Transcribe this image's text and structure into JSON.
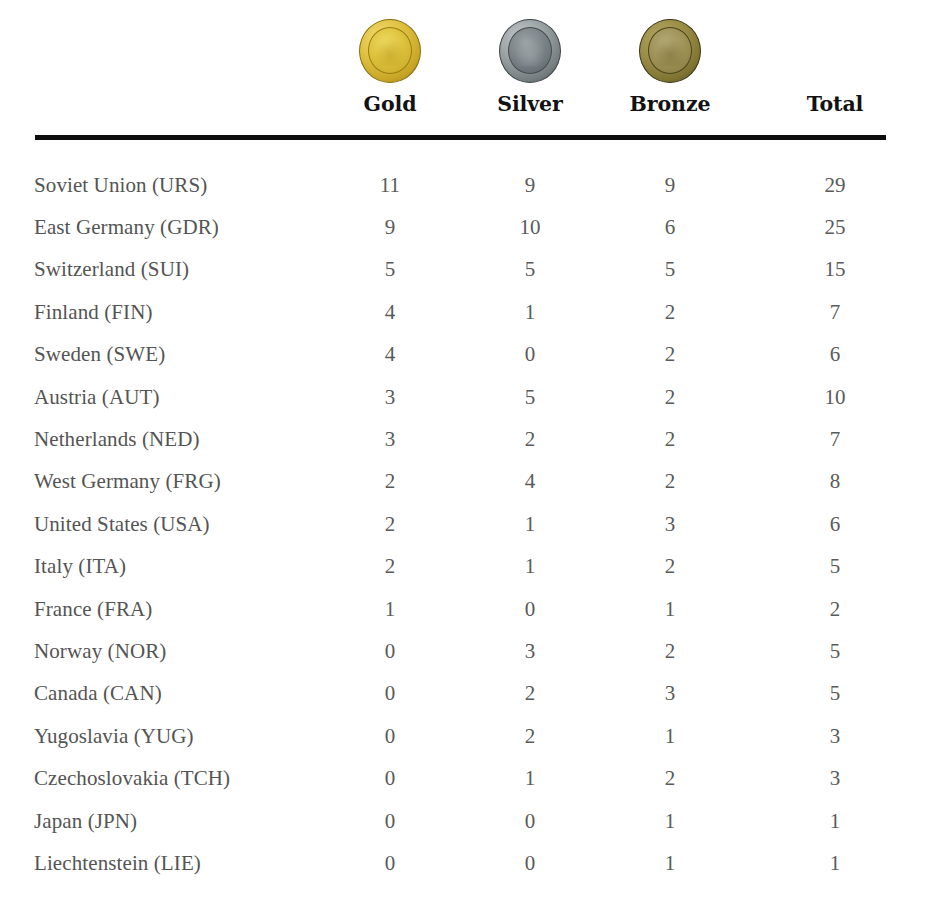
{
  "table": {
    "columns": [
      {
        "key": "nation",
        "label": "",
        "icon": null,
        "align": "left"
      },
      {
        "key": "gold",
        "label": "Gold",
        "icon": "gold-medal-icon",
        "align": "center"
      },
      {
        "key": "silver",
        "label": "Silver",
        "icon": "silver-medal-icon",
        "align": "center"
      },
      {
        "key": "bronze",
        "label": "Bronze",
        "icon": "bronze-medal-icon",
        "align": "center"
      },
      {
        "key": "total",
        "label": "Total",
        "icon": null,
        "align": "center"
      }
    ],
    "rows": [
      {
        "nation": "Soviet Union (URS)",
        "gold": "11",
        "silver": "9",
        "bronze": "9",
        "total": "29"
      },
      {
        "nation": "East Germany (GDR)",
        "gold": "9",
        "silver": "10",
        "bronze": "6",
        "total": "25"
      },
      {
        "nation": "Switzerland (SUI)",
        "gold": "5",
        "silver": "5",
        "bronze": "5",
        "total": "15"
      },
      {
        "nation": "Finland (FIN)",
        "gold": "4",
        "silver": "1",
        "bronze": "2",
        "total": "7"
      },
      {
        "nation": "Sweden (SWE)",
        "gold": "4",
        "silver": "0",
        "bronze": "2",
        "total": "6"
      },
      {
        "nation": "Austria (AUT)",
        "gold": "3",
        "silver": "5",
        "bronze": "2",
        "total": "10"
      },
      {
        "nation": "Netherlands (NED)",
        "gold": "3",
        "silver": "2",
        "bronze": "2",
        "total": "7"
      },
      {
        "nation": "West Germany (FRG)",
        "gold": "2",
        "silver": "4",
        "bronze": "2",
        "total": "8"
      },
      {
        "nation": "United States (USA)",
        "gold": "2",
        "silver": "1",
        "bronze": "3",
        "total": "6"
      },
      {
        "nation": "Italy (ITA)",
        "gold": "2",
        "silver": "1",
        "bronze": "2",
        "total": "5"
      },
      {
        "nation": "France (FRA)",
        "gold": "1",
        "silver": "0",
        "bronze": "1",
        "total": "2"
      },
      {
        "nation": "Norway (NOR)",
        "gold": "0",
        "silver": "3",
        "bronze": "2",
        "total": "5"
      },
      {
        "nation": "Canada (CAN)",
        "gold": "0",
        "silver": "2",
        "bronze": "3",
        "total": "5"
      },
      {
        "nation": "Yugoslavia (YUG)",
        "gold": "0",
        "silver": "2",
        "bronze": "1",
        "total": "3"
      },
      {
        "nation": "Czechoslovakia (TCH)",
        "gold": "0",
        "silver": "1",
        "bronze": "2",
        "total": "3"
      },
      {
        "nation": "Japan (JPN)",
        "gold": "0",
        "silver": "0",
        "bronze": "1",
        "total": "1"
      },
      {
        "nation": "Liechtenstein (LIE)",
        "gold": "0",
        "silver": "0",
        "bronze": "1",
        "total": "1"
      }
    ]
  },
  "colors": {
    "background": "#ffffff",
    "rule": "#0d0d0d",
    "header_text": "#121212",
    "body_text": "#545454",
    "gold": "#d9be3e",
    "silver": "#7b8488",
    "bronze": "#9b8e48"
  }
}
